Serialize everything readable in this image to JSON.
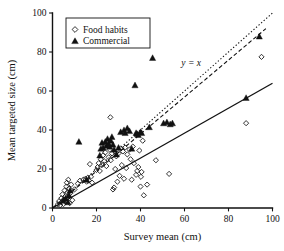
{
  "chart_data": {
    "type": "scatter",
    "title": "",
    "xlabel": "Survey mean (cm)",
    "ylabel": "Mean targeted size (cm)",
    "xlim": [
      0,
      100
    ],
    "ylim": [
      0,
      100
    ],
    "xticks": [
      0,
      20,
      40,
      60,
      80,
      100
    ],
    "yticks": [
      0,
      20,
      40,
      60,
      80,
      100
    ],
    "grid": false,
    "legend_position": "upper-left",
    "legend": [
      {
        "label": "Food habits",
        "marker": "open-diamond"
      },
      {
        "label": "Commercial",
        "marker": "filled-triangle"
      }
    ],
    "annotations": [
      {
        "text": "y = x",
        "x": 63,
        "y": 73,
        "style": "italic"
      }
    ],
    "reference_lines": [
      {
        "name": "identity-line",
        "label": "y = x",
        "style": "dotted",
        "x0": 0,
        "y0": 0,
        "x1": 100,
        "y1": 100
      },
      {
        "name": "commercial-fit-line",
        "style": "dashed",
        "x0": 0,
        "y0": 0,
        "x1": 97,
        "y1": 92
      },
      {
        "name": "food-habits-fit-line",
        "style": "solid",
        "x0": 0,
        "y0": 0,
        "x1": 100,
        "y1": 64
      }
    ],
    "series": [
      {
        "name": "Food habits",
        "marker": "open-diamond",
        "points": [
          [
            2.5,
            2.0
          ],
          [
            3.0,
            3.5
          ],
          [
            3.5,
            1.5
          ],
          [
            4.0,
            5.0
          ],
          [
            4.2,
            3.0
          ],
          [
            4.5,
            7.0
          ],
          [
            5.0,
            2.0
          ],
          [
            5.2,
            4.5
          ],
          [
            5.5,
            9.0
          ],
          [
            5.8,
            6.0
          ],
          [
            6.0,
            3.0
          ],
          [
            6.3,
            11.0
          ],
          [
            6.5,
            13.0
          ],
          [
            6.8,
            8.0
          ],
          [
            7.0,
            5.5
          ],
          [
            7.2,
            14.5
          ],
          [
            7.5,
            10.0
          ],
          [
            7.8,
            2.5
          ],
          [
            8.0,
            7.5
          ],
          [
            8.5,
            12.0
          ],
          [
            9.0,
            4.0
          ],
          [
            10.0,
            9.5
          ],
          [
            11.5,
            12.5
          ],
          [
            12.5,
            14.0
          ],
          [
            14.0,
            14.5
          ],
          [
            15.0,
            15.0
          ],
          [
            15.5,
            13.5
          ],
          [
            16.0,
            15.5
          ],
          [
            16.5,
            14.0
          ],
          [
            17.0,
            22.5
          ],
          [
            17.5,
            16.0
          ],
          [
            18.0,
            13.0
          ],
          [
            20.0,
            19.5
          ],
          [
            20.5,
            21.0
          ],
          [
            21.0,
            23.0
          ],
          [
            21.5,
            19.0
          ],
          [
            22.0,
            25.0
          ],
          [
            22.5,
            22.0
          ],
          [
            23.0,
            27.0
          ],
          [
            23.5,
            24.0
          ],
          [
            24.0,
            28.5
          ],
          [
            24.5,
            21.5
          ],
          [
            25.0,
            34.0
          ],
          [
            25.5,
            26.0
          ],
          [
            26.0,
            30.0
          ],
          [
            26.3,
            46.5
          ],
          [
            26.5,
            24.5
          ],
          [
            27.0,
            28.0
          ],
          [
            27.5,
            9.5
          ],
          [
            28.0,
            10.5
          ],
          [
            28.5,
            20.0
          ],
          [
            29.0,
            26.5
          ],
          [
            29.5,
            13.5
          ],
          [
            30.0,
            28.0
          ],
          [
            30.5,
            16.5
          ],
          [
            31.0,
            30.5
          ],
          [
            31.5,
            22.0
          ],
          [
            32.0,
            29.0
          ],
          [
            32.5,
            15.0
          ],
          [
            33.0,
            31.0
          ],
          [
            33.5,
            20.5
          ],
          [
            34.0,
            27.5
          ],
          [
            35.0,
            30.0
          ],
          [
            35.5,
            25.0
          ],
          [
            36.0,
            14.5
          ],
          [
            36.5,
            31.5
          ],
          [
            37.0,
            23.0
          ],
          [
            38.0,
            17.0
          ],
          [
            38.5,
            19.0
          ],
          [
            39.0,
            21.0
          ],
          [
            39.5,
            29.5
          ],
          [
            40.0,
            11.0
          ],
          [
            40.2,
            16.0
          ],
          [
            40.5,
            18.5
          ],
          [
            41.0,
            34.5
          ],
          [
            41.5,
            6.5
          ],
          [
            43.0,
            12.0
          ],
          [
            47.0,
            24.5
          ],
          [
            53.0,
            17.5
          ],
          [
            88.0,
            43.5
          ],
          [
            95.0,
            77.5
          ]
        ]
      },
      {
        "name": "Commercial",
        "marker": "filled-triangle",
        "points": [
          [
            5.0,
            4.0
          ],
          [
            6.0,
            5.0
          ],
          [
            7.0,
            3.0
          ],
          [
            7.5,
            6.5
          ],
          [
            8.0,
            9.0
          ],
          [
            12.0,
            34.0
          ],
          [
            15.5,
            14.5
          ],
          [
            21.5,
            27.0
          ],
          [
            22.0,
            30.5
          ],
          [
            22.5,
            33.5
          ],
          [
            23.0,
            31.0
          ],
          [
            24.0,
            34.0
          ],
          [
            24.5,
            32.0
          ],
          [
            25.0,
            35.5
          ],
          [
            25.5,
            33.0
          ],
          [
            26.0,
            31.5
          ],
          [
            26.5,
            34.5
          ],
          [
            27.0,
            36.5
          ],
          [
            27.5,
            32.5
          ],
          [
            28.0,
            30.0
          ],
          [
            29.0,
            27.5
          ],
          [
            30.0,
            31.0
          ],
          [
            31.0,
            39.0
          ],
          [
            32.5,
            40.0
          ],
          [
            33.0,
            38.5
          ],
          [
            34.0,
            41.0
          ],
          [
            35.0,
            39.5
          ],
          [
            36.0,
            30.5
          ],
          [
            37.5,
            63.0
          ],
          [
            38.0,
            38.5
          ],
          [
            38.5,
            38.0
          ],
          [
            39.0,
            37.5
          ],
          [
            40.0,
            39.0
          ],
          [
            40.5,
            38.5
          ],
          [
            44.0,
            41.5
          ],
          [
            45.5,
            77.0
          ],
          [
            50.5,
            43.5
          ],
          [
            52.0,
            44.0
          ],
          [
            53.5,
            43.0
          ],
          [
            54.5,
            43.5
          ],
          [
            88.0,
            56.5
          ],
          [
            94.0,
            88.0
          ]
        ]
      }
    ]
  },
  "axes": {
    "x_title": "Survey mean (cm)",
    "y_title": "Mean targeted size (cm)",
    "x_tick_labels": [
      "0",
      "20",
      "40",
      "60",
      "80",
      "100"
    ],
    "y_tick_labels": [
      "0",
      "20",
      "40",
      "60",
      "80",
      "100"
    ]
  },
  "legend": {
    "items": [
      {
        "label": "Food habits"
      },
      {
        "label": "Commercial"
      }
    ]
  },
  "annotation": {
    "identity_label": "y = x"
  },
  "colors": {
    "foreground": "#111111",
    "background": "#ffffff"
  }
}
